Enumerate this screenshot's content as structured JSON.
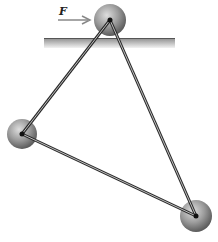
{
  "figure": {
    "force_label": "F",
    "colors": {
      "rod": "#2a2a2a",
      "ball_light": "#d0d0d0",
      "ball_dark": "#6a6a6a",
      "surface_top": "#555555",
      "surface_fill_light": "#e6e6e6",
      "surface_fill_dark": "#9a9a9a",
      "arrow": "#888888"
    },
    "balls": [
      {
        "name": "top-ball",
        "cx": 110,
        "cy": 20,
        "r": 16
      },
      {
        "name": "left-ball",
        "cx": 22,
        "cy": 134,
        "r": 15
      },
      {
        "name": "right-ball",
        "cx": 196,
        "cy": 216,
        "r": 16
      }
    ]
  }
}
